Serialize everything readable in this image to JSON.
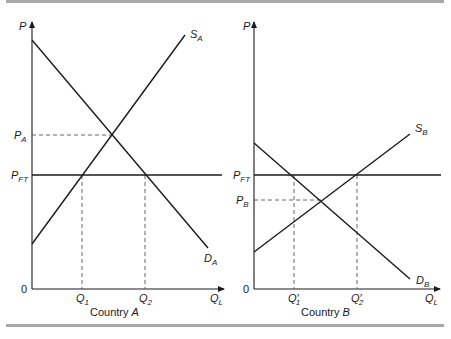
{
  "figure": {
    "rule_color": "#a8a8a8",
    "panels": [
      {
        "id": "A",
        "caption_prefix": "Country ",
        "caption_italic": "A",
        "y_axis_label": "P",
        "x_axis_label_main": "Q",
        "x_axis_label_sub": "L",
        "origin_label": "0",
        "supply_label_main": "S",
        "supply_label_sub": "A",
        "demand_label_main": "D",
        "demand_label_sub": "A",
        "autarky_price_main": "P",
        "autarky_price_sub": "A",
        "free_trade_price_main": "P",
        "free_trade_price_sub": "FT",
        "q1_main": "Q",
        "q1_sub": "1",
        "q1_prime": "",
        "q2_main": "Q",
        "q2_sub": "2",
        "q2_prime": ""
      },
      {
        "id": "B",
        "caption_prefix": "Country ",
        "caption_italic": "B",
        "y_axis_label": "P",
        "x_axis_label_main": "Q",
        "x_axis_label_sub": "L",
        "origin_label": "0",
        "supply_label_main": "S",
        "supply_label_sub": "B",
        "demand_label_main": "D",
        "demand_label_sub": "B",
        "autarky_price_main": "P",
        "autarky_price_sub": "B",
        "free_trade_price_main": "P",
        "free_trade_price_sub": "FT",
        "q1_main": "Q",
        "q1_sub": "1",
        "q1_prime": "′",
        "q2_main": "Q",
        "q2_sub": "2",
        "q2_prime": "′"
      }
    ]
  }
}
